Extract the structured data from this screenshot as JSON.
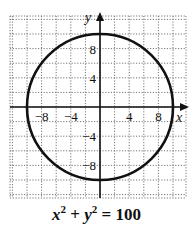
{
  "chart_data": {
    "type": "line",
    "caption": {
      "var1": "x",
      "exp1": "2",
      "plus": " + ",
      "var2": "y",
      "exp2": "2",
      "rhs": " = 100"
    },
    "xlabel": "x",
    "ylabel": "y",
    "xlim": [
      -12,
      12
    ],
    "ylim": [
      -12,
      13
    ],
    "grid": true,
    "grid_style": "dotted",
    "grid_step": 2,
    "x_ticks": [
      -8,
      -4,
      4,
      8
    ],
    "y_ticks": [
      8,
      4,
      -4,
      -8
    ],
    "x_tick_labels": [
      "−8",
      "−4",
      "4",
      "8"
    ],
    "y_tick_labels": [
      "8",
      "4",
      "−4",
      "−8"
    ],
    "series": [
      {
        "name": "circle",
        "shape": "circle",
        "center": [
          0,
          0
        ],
        "radius": 10,
        "color": "#111111"
      }
    ]
  }
}
